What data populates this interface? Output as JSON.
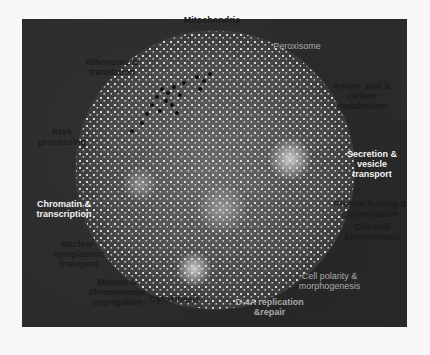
{
  "figure": {
    "type": "network-map",
    "background_color": "#2b2b2b",
    "node_color": "#f0f0f0",
    "cluster_highlight_color": "#c8c8c8",
    "dark_cluster_color": "#0d0d0d"
  },
  "labels": {
    "mitochondria": "Mitochondria",
    "ribosome": "Ribosome &\ntranslation",
    "peroxisome": "Peroxisome",
    "metabolism": "Amino acid &\ncarbon\nmetabolism",
    "rna_processing": "RNA\nprocessing",
    "secretion": "Secretion &\nvesicle\ntransport",
    "glycosylation": "Protein folding &\nglycosylation",
    "cell_wall": "Cell wall\nbiosynthesis",
    "chromatin": "Chromatin &\ntranscription",
    "nuclear_transport": "Nuclear-\ncytoplasmic\ntransport",
    "mitosis": "Mitosis &\nchromosome\nsegregation",
    "cytokinesis": "Cytokinesis",
    "cell_polarity": "Cell polarity &\nmorphogenesis",
    "dna_replication": "D-4A replication\n&repair"
  }
}
